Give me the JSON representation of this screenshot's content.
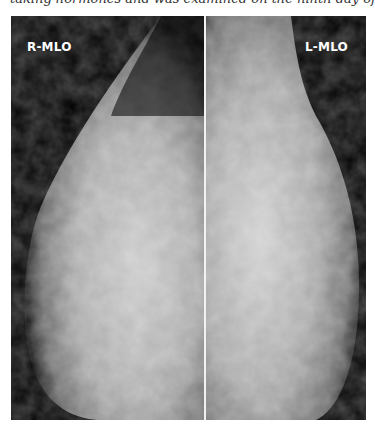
{
  "caption": {
    "text": "taking hormones and was examined on the ninth day of the cycle."
  },
  "figure": {
    "panels": [
      {
        "label": "R-MLO",
        "side": "right"
      },
      {
        "label": "L-MLO",
        "side": "left"
      }
    ],
    "colors": {
      "background": "#000000",
      "divider": "#f2f2f2",
      "label": "#ffffff"
    }
  }
}
